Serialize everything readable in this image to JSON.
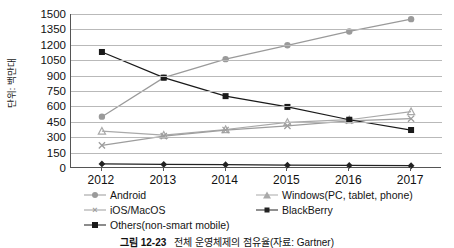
{
  "chart_data": {
    "type": "line",
    "title": "",
    "xlabel": "",
    "ylabel": "단위: 백만대",
    "categories": [
      "2012",
      "2013",
      "2014",
      "2015",
      "2016",
      "2017"
    ],
    "ylim": [
      0,
      1500
    ],
    "yticks": [
      0,
      150,
      300,
      450,
      600,
      750,
      900,
      1050,
      1200,
      1350,
      1500
    ],
    "grid": true,
    "legend_position": "bottom",
    "series": [
      {
        "name": "Android",
        "marker": "circle",
        "color": "#9a9a9a",
        "values": [
          500,
          880,
          1060,
          1195,
          1330,
          1450
        ]
      },
      {
        "name": "Windows(PC, tablet, phone)",
        "marker": "triangle",
        "color": "#a9a9a9",
        "values": [
          360,
          320,
          375,
          445,
          470,
          550
        ]
      },
      {
        "name": "iOS/MacOS",
        "marker": "x",
        "color": "#9d9d9d",
        "values": [
          220,
          310,
          370,
          410,
          460,
          480
        ]
      },
      {
        "name": "BlackBerry",
        "marker": "diamond",
        "color": "#222222",
        "values": [
          40,
          35,
          32,
          28,
          25,
          22
        ]
      },
      {
        "name": "Others(non-smart mobile)",
        "marker": "square",
        "color": "#1a1a1a",
        "values": [
          1130,
          880,
          700,
          595,
          470,
          370
        ]
      }
    ]
  },
  "caption": {
    "figure_number": "그림 12-23",
    "text": "전체 운영체제의 점유율(자료: Gartner)"
  },
  "legend": {
    "items": [
      {
        "label": "Android"
      },
      {
        "label": "Windows(PC, tablet, phone)"
      },
      {
        "label": "iOS/MacOS"
      },
      {
        "label": "BlackBerry"
      },
      {
        "label": "Others(non-smart mobile)"
      }
    ]
  },
  "colors": {
    "grid": "#b9b9b9",
    "axis": "#555555",
    "text": "#111111"
  }
}
